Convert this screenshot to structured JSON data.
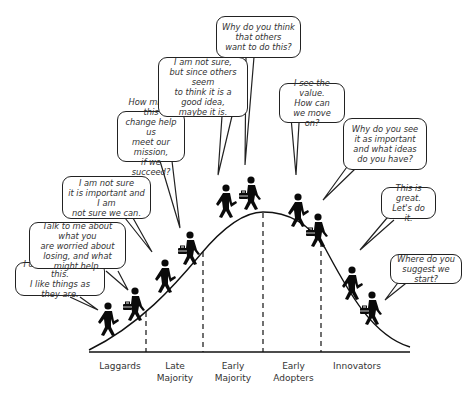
{
  "diagram": {
    "type": "diffusion-of-innovation-bell-curve",
    "segments": [
      {
        "id": "laggards",
        "label": "Laggards"
      },
      {
        "id": "late-majority",
        "label": "Late\nMajority"
      },
      {
        "id": "early-majority",
        "label": "Early\nMajority"
      },
      {
        "id": "early-adopters",
        "label": "Early\nAdopters"
      },
      {
        "id": "innovators",
        "label": "Innovators"
      }
    ],
    "bubbles": [
      {
        "id": "laggard-1",
        "text": "I don't want to do this.\nI like things as they are."
      },
      {
        "id": "laggard-2",
        "text": "Talk to me about what you\nare worried about\nlosing, and what might help."
      },
      {
        "id": "late-majority-1",
        "text": "I am not sure\nit is important and I am\nnot sure we can."
      },
      {
        "id": "late-majority-2",
        "text": "How might this\nchange help us\nmeet our mission,\nif we succeed?"
      },
      {
        "id": "early-majority-1",
        "text": "I am not sure,\nbut since others seem\nto think it is a good idea,\nmaybe it is."
      },
      {
        "id": "early-majority-2",
        "text": "Why do you think\nthat others\nwant to do this?"
      },
      {
        "id": "early-adopter-1",
        "text": "I see the value.\nHow can\nwe move on?"
      },
      {
        "id": "early-adopter-2",
        "text": "Why do you see\nit as important\nand what ideas\ndo you have?"
      },
      {
        "id": "innovator-1",
        "text": "This is great.\nLet's do it."
      },
      {
        "id": "innovator-2",
        "text": "Where do you\nsuggest we start?"
      }
    ],
    "colors": {
      "line": "#111111",
      "figure": "#0a0a0a",
      "text": "#333333"
    }
  }
}
